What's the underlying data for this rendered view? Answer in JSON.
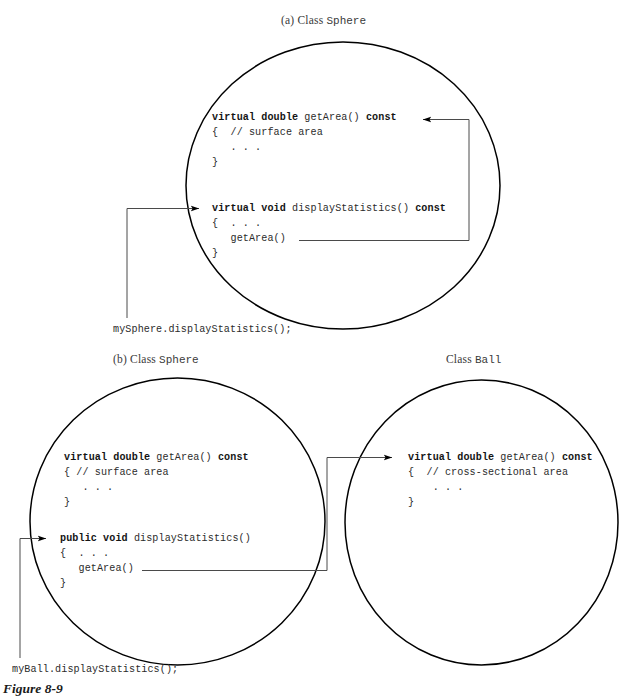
{
  "figure": {
    "label": "Figure 8-9"
  },
  "panels": [
    {
      "id": "a",
      "title_prefix": "(a) Class ",
      "title_class": "Sphere",
      "call_site": "mySphere.displayStatistics();",
      "methods": [
        {
          "name": "getArea",
          "sig_pre": "virtual double ",
          "sig_mid": "getArea() ",
          "sig_post": "const",
          "body_open": "{  // surface area",
          "body_dots": "   . . .",
          "body_close": "}"
        },
        {
          "name": "displayStatistics",
          "sig_pre": "virtual void ",
          "sig_mid": "displayStatistics() ",
          "sig_post": "const",
          "body_open": "{  . . .",
          "body_call": "   getArea()",
          "body_close": "}"
        }
      ]
    },
    {
      "id": "b",
      "title_prefix": "(b) Class ",
      "title_class": "Sphere",
      "title2_prefix": "Class ",
      "title2_class": "Ball",
      "call_site": "myBall.displayStatistics();",
      "methods": [
        {
          "name": "getArea",
          "sig_pre": "virtual double ",
          "sig_mid": "getArea() ",
          "sig_post": "const",
          "body_open": "{ // surface area",
          "body_dots": "   . . .",
          "body_close": "}"
        },
        {
          "name": "displayStatistics",
          "sig_pre": "public void ",
          "sig_mid": "displayStatistics()",
          "sig_post": "",
          "body_open": "{  . . .",
          "body_call": "   getArea()",
          "body_close": "}"
        }
      ],
      "methods_right": [
        {
          "name": "getArea",
          "sig_pre": "virtual double ",
          "sig_mid": "getArea() ",
          "sig_post": "const",
          "body_open": "{  // cross-sectional area",
          "body_dots": "    . . .",
          "body_close": "}"
        }
      ]
    }
  ],
  "colors": {
    "ink": "#231f20",
    "stroke": "#000000",
    "connector": "#4a4a4a",
    "background": "#ffffff"
  }
}
